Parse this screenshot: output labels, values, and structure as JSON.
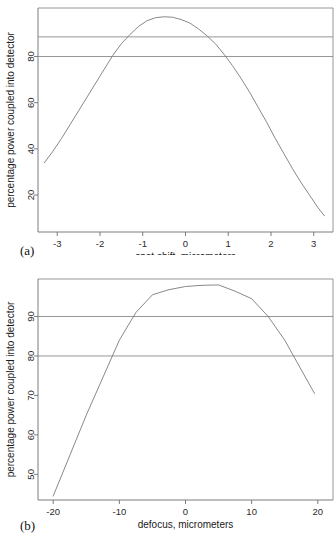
{
  "figure": {
    "panel_a_label": "(a)",
    "panel_b_label": "(b)"
  },
  "chart_data": [
    {
      "id": "panel-a",
      "type": "line",
      "title": "",
      "xlabel": "spot shift, micrometers",
      "ylabel": "percentage power coupled into detector",
      "xlim": [
        -3.45,
        3.45
      ],
      "ylim": [
        4,
        101
      ],
      "xticks": [
        -3,
        -2,
        -1,
        0,
        1,
        2,
        3
      ],
      "xticklabels": [
        "-3",
        "-2",
        "-1",
        "0",
        "1",
        "2",
        "3"
      ],
      "yticks": [
        20,
        40,
        60,
        80
      ],
      "yticklabels": [
        "20",
        "40",
        "60",
        "80"
      ],
      "grid": false,
      "legend": "none",
      "reference_lines": [
        {
          "axis": "y",
          "value": 88.5
        },
        {
          "axis": "y",
          "value": 80.0
        }
      ],
      "series": [
        {
          "name": "coupling efficiency vs spot shift",
          "x": [
            -3.3,
            -3.1,
            -2.9,
            -2.7,
            -2.5,
            -2.3,
            -2.1,
            -1.9,
            -1.7,
            -1.5,
            -1.3,
            -1.1,
            -0.9,
            -0.7,
            -0.5,
            -0.3,
            -0.1,
            0.1,
            0.3,
            0.5,
            0.7,
            0.9,
            1.1,
            1.3,
            1.5,
            1.7,
            1.9,
            2.1,
            2.3,
            2.5,
            2.7,
            2.9,
            3.1,
            3.25
          ],
          "y": [
            34.0,
            39.0,
            44.5,
            50.5,
            56.5,
            62.5,
            68.5,
            74.5,
            80.5,
            85.5,
            89.5,
            93.0,
            95.5,
            96.8,
            97.2,
            97.0,
            96.0,
            94.5,
            92.0,
            89.0,
            85.5,
            81.0,
            76.0,
            70.5,
            64.5,
            58.0,
            51.5,
            44.5,
            38.0,
            31.5,
            25.5,
            20.0,
            14.5,
            11.0
          ]
        }
      ]
    },
    {
      "id": "panel-b",
      "type": "line",
      "title": "",
      "xlabel": "defocus, micrometers",
      "ylabel": "percentage power coupled into detector",
      "xlim": [
        -22.3,
        22.3
      ],
      "ylim": [
        43.5,
        99.5
      ],
      "xticks": [
        -20,
        -10,
        0,
        10,
        20
      ],
      "xticklabels": [
        "-20",
        "-10",
        "0",
        "10",
        "20"
      ],
      "yticks": [
        50,
        60,
        70,
        80,
        90
      ],
      "yticklabels": [
        "50",
        "60",
        "70",
        "80",
        "90"
      ],
      "grid": false,
      "legend": "none",
      "reference_lines": [
        {
          "axis": "y",
          "value": 90.0
        },
        {
          "axis": "y",
          "value": 80.0
        }
      ],
      "series": [
        {
          "name": "coupling efficiency vs defocus",
          "x": [
            -20,
            -15,
            -10,
            -7.5,
            -5,
            -2.5,
            0,
            2.5,
            5,
            7.5,
            10,
            12.5,
            15,
            17.5,
            19.5
          ],
          "y": [
            44.5,
            65.0,
            84.0,
            91.0,
            95.5,
            96.8,
            97.6,
            97.9,
            98.0,
            96.4,
            94.5,
            90.0,
            84.0,
            76.5,
            70.5
          ]
        }
      ]
    }
  ]
}
